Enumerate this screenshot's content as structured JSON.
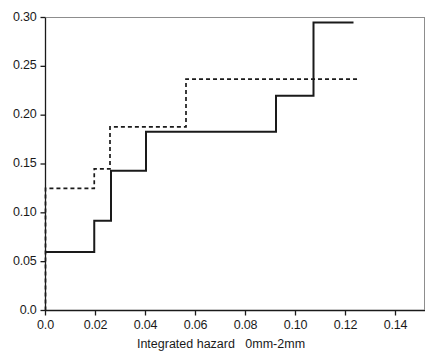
{
  "chart_data": {
    "type": "line",
    "title": "",
    "xlabel": "Integrated hazard   0mm-2mm",
    "ylabel": "",
    "xlim": [
      0.0,
      0.15
    ],
    "ylim": [
      0.0,
      0.3
    ],
    "grid": false,
    "legend": "none",
    "xticks": [
      0.0,
      0.02,
      0.04,
      0.06,
      0.08,
      0.1,
      0.12,
      0.14
    ],
    "xticklabels": [
      "0.0",
      "0.02",
      "0.04",
      "0.06",
      "0.08",
      "0.10",
      "0.12",
      "0.14"
    ],
    "yticks": [
      0.0,
      0.05,
      0.1,
      0.15,
      0.2,
      0.25,
      0.3
    ],
    "yticklabels": [
      "0.0",
      "0.05",
      "0.10",
      "0.15",
      "0.20",
      "0.25",
      "0.30"
    ],
    "series": [
      {
        "name": "solid-step",
        "style": "solid",
        "color": "#1a1a1a",
        "x": [
          0.0,
          0.0195,
          0.0195,
          0.0262,
          0.0262,
          0.0402,
          0.0402,
          0.0922,
          0.0922,
          0.1072,
          0.1072,
          0.1232
        ],
        "y": [
          0.06,
          0.06,
          0.092,
          0.092,
          0.143,
          0.143,
          0.183,
          0.183,
          0.22,
          0.22,
          0.295,
          0.295
        ]
      },
      {
        "name": "dashed-step",
        "style": "dashed",
        "color": "#1a1a1a",
        "x": [
          0.0,
          0.0,
          0.0195,
          0.0195,
          0.0258,
          0.0258,
          0.0562,
          0.0562,
          0.1252
        ],
        "y": [
          0.0,
          0.125,
          0.125,
          0.145,
          0.145,
          0.188,
          0.188,
          0.237,
          0.237
        ]
      }
    ]
  }
}
